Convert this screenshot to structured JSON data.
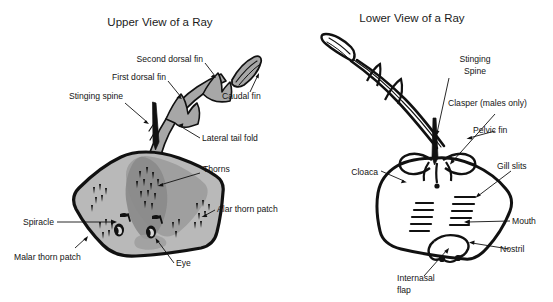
{
  "figure": {
    "background_color": "#ffffff",
    "ink_color": "#111111",
    "body_light_gray": "#b9b9b9",
    "body_mid_gray": "#9d9d9d",
    "body_dark_gray": "#8a8a8a"
  },
  "panels": [
    {
      "id": "upper-view",
      "title": "Upper View of a Ray",
      "labels": [
        {
          "key": "second_dorsal_fin",
          "text": "Second dorsal fin"
        },
        {
          "key": "first_dorsal_fin",
          "text": "First dorsal fin"
        },
        {
          "key": "stinging_spine",
          "text": "Stinging spine"
        },
        {
          "key": "caudal_fin",
          "text": "Caudal fin"
        },
        {
          "key": "lateral_tail_fold",
          "text": "Lateral tail fold"
        },
        {
          "key": "thorns",
          "text": "Thorns"
        },
        {
          "key": "alar_thorn_patch",
          "text": "Alar thorn patch"
        },
        {
          "key": "spiracle",
          "text": "Spiracle"
        },
        {
          "key": "malar_thorn_patch",
          "text": "Malar thorn patch"
        },
        {
          "key": "eye",
          "text": "Eye"
        }
      ]
    },
    {
      "id": "lower-view",
      "title": "Lower View of a Ray",
      "labels": [
        {
          "key": "stinging_spine_l1",
          "text": "Stinging"
        },
        {
          "key": "stinging_spine_l2",
          "text": "Spine"
        },
        {
          "key": "clasper",
          "text": "Clasper (males only)"
        },
        {
          "key": "pelvic_fin",
          "text": "Pelvic fin"
        },
        {
          "key": "cloaca",
          "text": "Cloaca"
        },
        {
          "key": "gill_slits",
          "text": "Gill slits"
        },
        {
          "key": "mouth",
          "text": "Mouth"
        },
        {
          "key": "nostril",
          "text": "Nostril"
        },
        {
          "key": "internasal_l1",
          "text": "Internasal"
        },
        {
          "key": "internasal_l2",
          "text": "flap"
        }
      ]
    }
  ]
}
